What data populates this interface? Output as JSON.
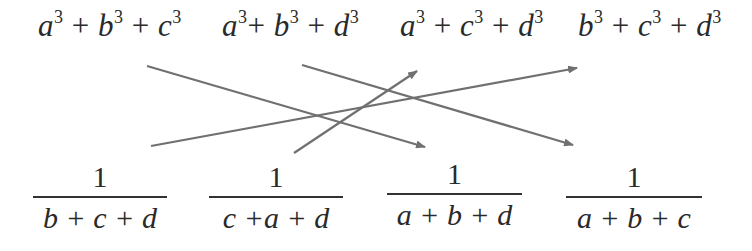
{
  "diagram": {
    "top_expressions": [
      {
        "id": "abc",
        "terms": [
          "a",
          "b",
          "c"
        ],
        "exponent": "3",
        "text": "a³ + b³ + c³"
      },
      {
        "id": "abd",
        "terms": [
          "a",
          "b",
          "d"
        ],
        "exponent": "3",
        "text": "a³+ b³ + d³"
      },
      {
        "id": "acd",
        "terms": [
          "a",
          "c",
          "d"
        ],
        "exponent": "3",
        "text": "a³ + c³ + d³"
      },
      {
        "id": "bcd",
        "terms": [
          "b",
          "c",
          "d"
        ],
        "exponent": "3",
        "text": "b³ + c³ + d³"
      }
    ],
    "bottom_fractions": [
      {
        "numerator": "1",
        "denominator": "b + c + d"
      },
      {
        "numerator": "1",
        "denominator": "c +a + d"
      },
      {
        "numerator": "1",
        "denominator": "a + b + d"
      },
      {
        "numerator": "1",
        "denominator": "a + b + c"
      }
    ],
    "plus": "+",
    "arrows": [
      {
        "from": "top:a³ + b³ + c³",
        "to": "bottom:1/(a + b + d)",
        "x1": 147,
        "y1": 66,
        "x2": 425,
        "y2": 147
      },
      {
        "from": "top:a³+ b³ + d³",
        "to": "bottom:1/(a + b + c)",
        "x1": 302,
        "y1": 65,
        "x2": 573,
        "y2": 145
      },
      {
        "from": "bottom:1/(b + c + d)",
        "to": "top:b³ + c³ + d³",
        "x1": 151,
        "y1": 146,
        "x2": 577,
        "y2": 68
      },
      {
        "from": "bottom:1/(c +a + d)",
        "to": "top:a³ + c³ + d³",
        "x1": 294,
        "y1": 153,
        "x2": 417,
        "y2": 71
      }
    ],
    "colors": {
      "text": "#2a2a2a",
      "arrow": "#707070"
    }
  }
}
